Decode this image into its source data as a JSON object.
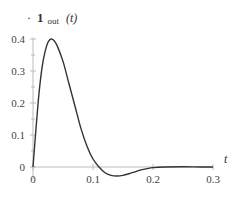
{
  "chart_data": {
    "type": "line",
    "title": "",
    "xlabel": "t",
    "ylabel": "1_out (t)",
    "ylabel_parts": {
      "main": "1",
      "sub": "out",
      "arg": "(t)"
    },
    "xlim": [
      0,
      0.3
    ],
    "ylim": [
      -0.04,
      0.43
    ],
    "grid": false,
    "legend": null,
    "x_ticks": [
      0,
      0.1,
      0.2,
      0.3
    ],
    "x_tick_labels": [
      "0",
      "0.1",
      "0.2",
      "0.3"
    ],
    "y_ticks": [
      0,
      0.1,
      0.2,
      0.3,
      0.4
    ],
    "y_tick_labels": [
      "0",
      "0.1",
      "0.2",
      "0.3",
      "0.4"
    ],
    "y_minor_ticks": [
      0.05,
      0.15,
      0.25,
      0.35
    ],
    "series": [
      {
        "name": "1_out(t)",
        "x": [
          0,
          0.005,
          0.01,
          0.015,
          0.02,
          0.025,
          0.03,
          0.035,
          0.04,
          0.05,
          0.06,
          0.07,
          0.08,
          0.09,
          0.1,
          0.11,
          0.12,
          0.13,
          0.14,
          0.15,
          0.16,
          0.17,
          0.18,
          0.19,
          0.2,
          0.22,
          0.25,
          0.28,
          0.3
        ],
        "values": [
          0,
          0.12,
          0.23,
          0.31,
          0.36,
          0.39,
          0.4,
          0.395,
          0.38,
          0.33,
          0.26,
          0.19,
          0.12,
          0.065,
          0.025,
          0.0,
          -0.018,
          -0.026,
          -0.028,
          -0.026,
          -0.021,
          -0.015,
          -0.009,
          -0.005,
          -0.002,
          0.0,
          0.001,
          0.0,
          0.0
        ]
      }
    ]
  },
  "colors": {
    "curve": "#333333",
    "axis": "#bbbbbb",
    "text": "#444444"
  }
}
